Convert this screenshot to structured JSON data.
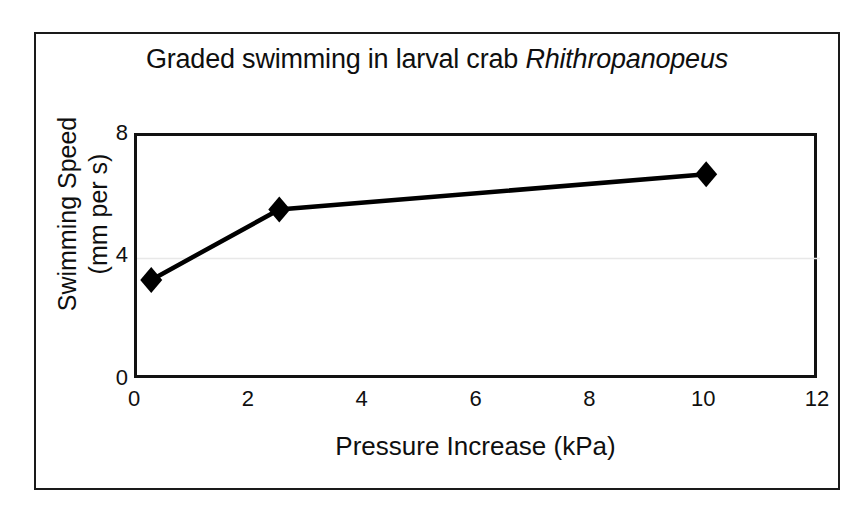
{
  "figure": {
    "background_color": "#ffffff",
    "frame_color": "#1a1a1a",
    "axes_color": "#121212",
    "series_color": "#000000",
    "gridline_color": "#e8e8e8"
  },
  "chart_data": {
    "type": "line",
    "title": "Graded swimming in larval crab Rhithropanopeus",
    "title_plain": "Graded swimming in larval crab ",
    "title_italic": "Rhithropanopeus",
    "xlabel": "Pressure Increase (kPa)",
    "ylabel": "Swimming Speed (mm per s)",
    "ylabel_line1": "Swimming Speed",
    "ylabel_line2": "(mm per s)",
    "xlim": [
      0,
      12
    ],
    "ylim": [
      0,
      8
    ],
    "xticks": [
      0,
      2,
      4,
      6,
      8,
      10,
      12
    ],
    "xtick_labels": [
      "0",
      "2",
      "4",
      "6",
      "8",
      "10",
      "12"
    ],
    "yticks": [
      0,
      4,
      8
    ],
    "ytick_labels": [
      "0",
      "4",
      "8"
    ],
    "grid": "horizontal-faint-at-4",
    "legend": "none",
    "marker": "filled-diamond",
    "series": [
      {
        "name": "Swimming speed",
        "x": [
          0.25,
          2.5,
          10
        ],
        "y": [
          3.3,
          5.6,
          6.75
        ]
      }
    ],
    "points": [
      {
        "x": 0.25,
        "y": 3.3
      },
      {
        "x": 2.5,
        "y": 5.6
      },
      {
        "x": 10,
        "y": 6.75
      }
    ]
  }
}
